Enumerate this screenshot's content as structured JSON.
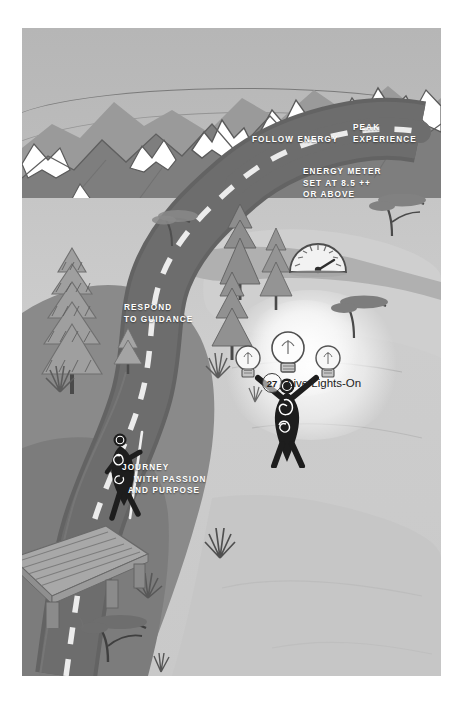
{
  "illustration": {
    "title": "Journey landscape illustration",
    "chapter_marker": {
      "number": "27",
      "label": "Live Lights-On"
    },
    "labels": [
      {
        "id": "peak-experience",
        "text": "PEAK EXPERIENCE"
      },
      {
        "id": "follow-energy",
        "text": "FOLLOW ENERGY"
      },
      {
        "id": "energy-meter",
        "line1": "ENERGY METER",
        "line2": "SET AT 8.5 ++",
        "line3": "OR ABOVE"
      },
      {
        "id": "respond-to-guidance",
        "line1": "RESPOND",
        "line2": "TO GUIDANCE"
      },
      {
        "id": "journey-passion",
        "line1": "JOURNEY",
        "line2": "WITH PASSION",
        "line3": "AND PURPOSE"
      }
    ],
    "colors": {
      "background": "#ffffff",
      "sky": "#b6b6b6",
      "valley": "#c9c9c9",
      "mountain": "#8d8d8d",
      "road": "#6a6a6a",
      "snow": "#ffffff",
      "ink": "#232323",
      "road_dash": "#e8e8e8"
    }
  }
}
